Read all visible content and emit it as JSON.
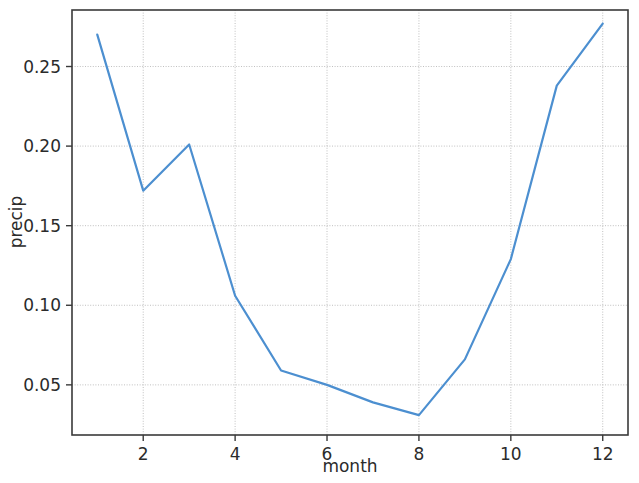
{
  "chart_data": {
    "type": "line",
    "title": "",
    "subtitle": "",
    "xlabel": "month",
    "ylabel": "precip",
    "x": [
      1,
      2,
      3,
      4,
      5,
      6,
      7,
      8,
      9,
      10,
      11,
      12
    ],
    "values": [
      0.27,
      0.172,
      0.201,
      0.106,
      0.059,
      0.05,
      0.039,
      0.031,
      0.066,
      0.129,
      0.238,
      0.277
    ],
    "series": [
      {
        "name": "precip",
        "values": [
          0.27,
          0.172,
          0.201,
          0.106,
          0.059,
          0.05,
          0.039,
          0.031,
          0.066,
          0.129,
          0.238,
          0.277
        ]
      }
    ],
    "xlim": [
      0.45,
      12.55
    ],
    "ylim": [
      0.0185,
      0.2855
    ],
    "xticks": [
      2,
      4,
      6,
      8,
      10,
      12
    ],
    "xtick_labels": [
      "2",
      "4",
      "6",
      "8",
      "10",
      "12"
    ],
    "yticks": [
      0.05,
      0.1,
      0.15,
      0.2,
      0.25
    ],
    "ytick_labels": [
      "0.05",
      "0.10",
      "0.15",
      "0.20",
      "0.25"
    ],
    "grid": true,
    "grid_axis": "both",
    "legend": false,
    "legend_position": "none",
    "line_color": "#4c8fd0",
    "line_width": 2.2,
    "markers": false,
    "background_color": "#ffffff",
    "grid_color": "#b9b9b9",
    "axis_color": "#3a3a3a",
    "text_color": "#2b2b2b"
  },
  "axes": {
    "x_title": "month",
    "y_title": "precip"
  }
}
